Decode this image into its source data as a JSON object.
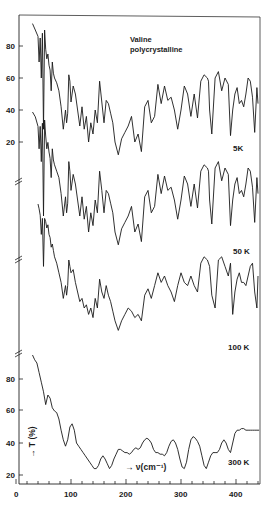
{
  "chart_data": {
    "type": "line",
    "title": "Valine polycrystalline",
    "title_lines": [
      "Valine",
      "polycrystalline"
    ],
    "xlabel": "→ ν(cm⁻¹)",
    "ylabel": "→ T (%)",
    "xlim": [
      0,
      440
    ],
    "ylim": [
      15,
      95
    ],
    "x_ticks": [
      0,
      100,
      200,
      300,
      400
    ],
    "x_tick_labels": [
      "0",
      "100",
      "200",
      "300",
      "400"
    ],
    "y_ticks_top": [
      80,
      60,
      40,
      20
    ],
    "y_ticks_bottom": [
      80,
      60,
      40,
      20
    ],
    "y_tick_labels": [
      "80",
      "60",
      "40",
      "20"
    ],
    "grid": false,
    "legend": "none (curves labelled inline)",
    "note": "Curves for 50 K and 100 K are vertically offset; axis breaks shown on left spine",
    "series": [
      {
        "name": "5K",
        "label": "5K",
        "y_offset_px": 0,
        "x": [
          30,
          35,
          40,
          42,
          44,
          46,
          48,
          50,
          52,
          54,
          56,
          58,
          60,
          62,
          64,
          66,
          68,
          70,
          74,
          78,
          82,
          86,
          90,
          92,
          94,
          96,
          98,
          100,
          104,
          108,
          112,
          116,
          120,
          124,
          128,
          132,
          136,
          140,
          144,
          148,
          152,
          156,
          160,
          164,
          168,
          172,
          176,
          180,
          186,
          192,
          198,
          204,
          210,
          216,
          222,
          228,
          234,
          240,
          246,
          252,
          258,
          264,
          270,
          276,
          282,
          288,
          294,
          300,
          306,
          312,
          318,
          324,
          330,
          336,
          342,
          348,
          350,
          352,
          356,
          362,
          368,
          374,
          380,
          386,
          390,
          394,
          398,
          402,
          406,
          410,
          414,
          418,
          422,
          426,
          430,
          434,
          438,
          440
        ],
        "y": [
          94,
          90,
          86,
          70,
          85,
          60,
          88,
          28,
          90,
          78,
          72,
          75,
          68,
          65,
          52,
          70,
          63,
          60,
          57,
          52,
          42,
          28,
          40,
          32,
          38,
          62,
          58,
          45,
          55,
          50,
          40,
          30,
          42,
          28,
          36,
          20,
          32,
          25,
          40,
          32,
          58,
          45,
          32,
          46,
          44,
          38,
          32,
          20,
          12,
          22,
          26,
          30,
          36,
          20,
          25,
          14,
          42,
          46,
          32,
          36,
          56,
          44,
          55,
          46,
          48,
          40,
          28,
          40,
          55,
          50,
          36,
          50,
          35,
          58,
          62,
          60,
          58,
          40,
          25,
          60,
          64,
          52,
          60,
          56,
          24,
          40,
          50,
          54,
          44,
          46,
          42,
          50,
          60,
          58,
          48,
          26,
          54,
          44
        ]
      },
      {
        "name": "50K",
        "label": "50 K",
        "y_offset_px": 90,
        "x": [
          30,
          35,
          40,
          42,
          44,
          46,
          48,
          50,
          52,
          54,
          56,
          58,
          60,
          62,
          64,
          66,
          68,
          70,
          74,
          78,
          82,
          86,
          90,
          92,
          94,
          96,
          98,
          100,
          104,
          108,
          112,
          116,
          120,
          124,
          128,
          132,
          136,
          140,
          144,
          148,
          152,
          156,
          160,
          164,
          168,
          172,
          176,
          180,
          186,
          192,
          198,
          204,
          210,
          216,
          222,
          228,
          234,
          240,
          246,
          252,
          258,
          264,
          270,
          276,
          282,
          288,
          294,
          300,
          306,
          312,
          318,
          324,
          330,
          336,
          342,
          348,
          350,
          352,
          356,
          362,
          368,
          374,
          380,
          386,
          390,
          394,
          398,
          402,
          406,
          410,
          414,
          418,
          422,
          426,
          430,
          434,
          438,
          440
        ],
        "y": [
          95,
          92,
          86,
          72,
          86,
          64,
          88,
          30,
          90,
          80,
          72,
          76,
          70,
          66,
          54,
          72,
          65,
          62,
          58,
          54,
          44,
          30,
          42,
          32,
          38,
          64,
          58,
          46,
          56,
          50,
          40,
          30,
          42,
          28,
          36,
          20,
          32,
          24,
          40,
          32,
          58,
          46,
          32,
          46,
          44,
          38,
          32,
          20,
          12,
          22,
          26,
          30,
          36,
          20,
          25,
          14,
          42,
          46,
          32,
          36,
          56,
          44,
          55,
          46,
          48,
          40,
          28,
          40,
          55,
          50,
          36,
          50,
          35,
          58,
          62,
          60,
          58,
          40,
          25,
          60,
          64,
          52,
          60,
          56,
          24,
          40,
          50,
          54,
          44,
          46,
          42,
          50,
          60,
          58,
          48,
          26,
          54,
          44
        ]
      },
      {
        "name": "100K",
        "label": "100 K",
        "y_offset_px": 182,
        "x": [
          40,
          42,
          44,
          46,
          48,
          50,
          52,
          54,
          56,
          58,
          60,
          62,
          64,
          66,
          68,
          70,
          74,
          78,
          82,
          86,
          90,
          92,
          94,
          96,
          98,
          100,
          104,
          108,
          112,
          116,
          120,
          124,
          128,
          132,
          136,
          140,
          144,
          148,
          152,
          156,
          160,
          164,
          168,
          172,
          176,
          180,
          186,
          192,
          198,
          204,
          210,
          216,
          222,
          228,
          234,
          240,
          246,
          252,
          258,
          264,
          270,
          276,
          282,
          288,
          294,
          300,
          306,
          312,
          318,
          324,
          330,
          336,
          342,
          348,
          352,
          356,
          362,
          368,
          374,
          380,
          386,
          390,
          394,
          398,
          402,
          406,
          410,
          414,
          418,
          422,
          426,
          430,
          434,
          438,
          440
        ],
        "y": [
          95,
          92,
          88,
          76,
          86,
          56,
          86,
          84,
          80,
          82,
          76,
          74,
          68,
          70,
          66,
          62,
          58,
          52,
          46,
          36,
          44,
          38,
          44,
          60,
          56,
          52,
          54,
          46,
          40,
          34,
          36,
          30,
          32,
          26,
          30,
          24,
          36,
          30,
          48,
          40,
          36,
          44,
          38,
          34,
          28,
          22,
          16,
          22,
          26,
          30,
          28,
          24,
          26,
          22,
          38,
          42,
          36,
          44,
          52,
          46,
          50,
          44,
          40,
          34,
          44,
          52,
          46,
          44,
          50,
          44,
          40,
          58,
          62,
          60,
          56,
          38,
          30,
          60,
          62,
          56,
          50,
          58,
          26,
          40,
          48,
          52,
          46,
          46,
          44,
          50,
          56,
          58,
          40,
          30,
          50
        ]
      },
      {
        "name": "300K",
        "label": "300 K",
        "y_offset_px": 0,
        "x": [
          30,
          34,
          38,
          42,
          46,
          50,
          54,
          58,
          62,
          66,
          70,
          74,
          78,
          82,
          86,
          90,
          94,
          98,
          102,
          106,
          110,
          114,
          118,
          122,
          126,
          130,
          134,
          138,
          142,
          146,
          150,
          154,
          158,
          162,
          166,
          170,
          174,
          178,
          182,
          186,
          190,
          194,
          198,
          202,
          206,
          210,
          214,
          218,
          222,
          226,
          230,
          234,
          238,
          242,
          246,
          250,
          254,
          258,
          262,
          266,
          270,
          274,
          278,
          282,
          286,
          290,
          294,
          298,
          302,
          306,
          310,
          314,
          318,
          322,
          326,
          330,
          334,
          338,
          342,
          346,
          350,
          354,
          358,
          362,
          366,
          370,
          374,
          378,
          382,
          386,
          390,
          394,
          398,
          402,
          406,
          410,
          414,
          418,
          422,
          426,
          430,
          434,
          438,
          442
        ],
        "y": [
          95,
          92,
          90,
          84,
          78,
          72,
          64,
          70,
          68,
          62,
          60,
          59,
          55,
          48,
          42,
          38,
          42,
          50,
          52,
          48,
          40,
          38,
          36,
          34,
          32,
          30,
          28,
          26,
          24,
          24,
          26,
          30,
          32,
          30,
          27,
          24,
          26,
          30,
          33,
          36,
          36,
          35,
          34,
          34,
          33,
          34,
          36,
          37,
          36,
          37,
          40,
          42,
          43,
          42,
          40,
          36,
          34,
          34,
          33,
          33,
          32,
          34,
          38,
          41,
          42,
          40,
          36,
          30,
          25,
          24,
          28,
          36,
          42,
          44,
          43,
          41,
          38,
          32,
          26,
          24,
          28,
          32,
          34,
          34,
          34,
          36,
          40,
          42,
          40,
          36,
          34,
          40,
          46,
          48,
          48,
          49,
          49,
          48,
          48,
          48,
          48,
          48,
          48,
          48
        ]
      }
    ]
  },
  "labels": {
    "title_line1": "Valine",
    "title_line2": "polycrystalline",
    "series_5k": "5K",
    "series_50k": "50 K",
    "series_100k": "100 K",
    "series_300k": "300 K",
    "xlabel": "→ ν(cm⁻¹)",
    "ylabel": "→ T (%)",
    "xtick_0": "0",
    "xtick_100": "100",
    "xtick_200": "200",
    "xtick_300": "300",
    "xtick_400": "400",
    "ytick_top_80": "80",
    "ytick_top_60": "60",
    "ytick_top_40": "40",
    "ytick_top_20": "20",
    "ytick_bot_80": "80",
    "ytick_bot_60": "60",
    "ytick_bot_40": "40",
    "ytick_bot_20": "20"
  }
}
